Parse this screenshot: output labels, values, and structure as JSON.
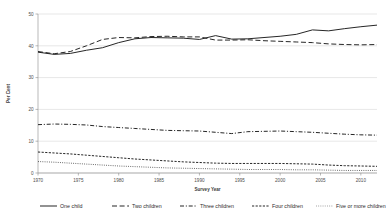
{
  "chart_data": {
    "type": "line",
    "title": "",
    "xlabel": "Survey Year",
    "ylabel": "Per Cent",
    "xlim": [
      1970,
      2012
    ],
    "ylim": [
      0,
      50
    ],
    "xticks": [
      "1970",
      "1975",
      "1980",
      "1985",
      "1990",
      "1995",
      "2000",
      "2005",
      "2010"
    ],
    "xtick_values": [
      1970,
      1975,
      1980,
      1985,
      1990,
      1995,
      2000,
      2005,
      2010
    ],
    "yticks": [
      "0",
      "10",
      "20",
      "30",
      "40",
      "50"
    ],
    "ytick_values": [
      0,
      10,
      20,
      30,
      40,
      50
    ],
    "grid": "horizontal",
    "legend_position": "bottom",
    "x": [
      1970,
      1972,
      1974,
      1976,
      1978,
      1980,
      1982,
      1984,
      1986,
      1988,
      1990,
      1992,
      1994,
      1996,
      1998,
      2000,
      2002,
      2004,
      2006,
      2008,
      2010,
      2012
    ],
    "series": [
      {
        "name": "One child",
        "style": "solid",
        "color": "#1a1a1a",
        "values": [
          38.0,
          37.3,
          37.6,
          38.6,
          39.4,
          41.0,
          42.2,
          42.6,
          42.5,
          42.4,
          42.0,
          43.2,
          42.1,
          42.2,
          42.6,
          43.0,
          43.6,
          45.0,
          44.7,
          45.4,
          46.0,
          46.5
        ]
      },
      {
        "name": "Two children",
        "style": "dashed",
        "color": "#1a1a1a",
        "values": [
          38.2,
          37.5,
          38.2,
          40.0,
          42.0,
          42.6,
          42.5,
          42.9,
          43.0,
          42.8,
          42.8,
          41.8,
          41.8,
          41.9,
          41.6,
          41.4,
          41.2,
          41.0,
          40.6,
          40.4,
          40.3,
          40.4
        ]
      },
      {
        "name": "Three children",
        "style": "dash-dot",
        "color": "#1a1a1a",
        "values": [
          15.2,
          15.4,
          15.3,
          15.1,
          14.6,
          14.3,
          14.0,
          13.7,
          13.4,
          13.3,
          13.2,
          12.8,
          12.4,
          13.0,
          13.1,
          13.2,
          13.0,
          12.8,
          12.5,
          12.2,
          12.0,
          11.9
        ]
      },
      {
        "name": "Four children",
        "style": "dash-short",
        "color": "#1a1a1a",
        "values": [
          6.6,
          6.3,
          6.0,
          5.6,
          5.2,
          4.8,
          4.4,
          4.1,
          3.8,
          3.5,
          3.3,
          3.1,
          3.0,
          3.0,
          3.0,
          3.0,
          2.9,
          2.8,
          2.5,
          2.3,
          2.2,
          2.1
        ]
      },
      {
        "name": "Five or more children",
        "style": "dotted",
        "color": "#6e6e6e",
        "values": [
          3.6,
          3.4,
          3.1,
          2.8,
          2.5,
          2.2,
          2.0,
          1.8,
          1.6,
          1.5,
          1.4,
          1.3,
          1.2,
          1.1,
          1.1,
          1.1,
          1.0,
          1.0,
          0.9,
          0.8,
          0.8,
          0.8
        ]
      }
    ]
  },
  "legend": {
    "items": [
      {
        "label": "One child",
        "style": "solid"
      },
      {
        "label": "Two children",
        "style": "dashed"
      },
      {
        "label": "Three children",
        "style": "dash-dot"
      },
      {
        "label": "Four children",
        "style": "dash-short"
      },
      {
        "label": "Five or more children",
        "style": "dotted"
      }
    ]
  }
}
